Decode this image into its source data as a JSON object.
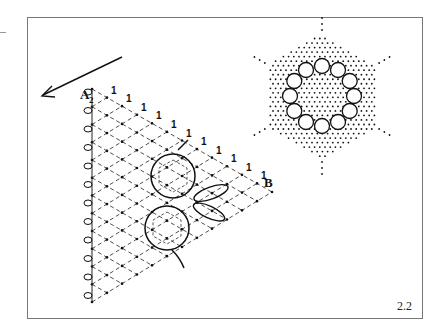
{
  "figure": {
    "number": "2.2",
    "labels": {
      "point_a": "A",
      "point_a_sub": "2",
      "point_b": "B",
      "pair_marker": "1"
    },
    "colors": {
      "ink": "#111111",
      "frame": "#777777",
      "background": "#ffffff"
    },
    "elements": [
      "direction-arrow",
      "triangular-pricking-grid",
      "edge-pinholes",
      "hexagonal-rings",
      "leaf-tallies",
      "hexagonal-ground-pricking",
      "flower-ring"
    ]
  }
}
